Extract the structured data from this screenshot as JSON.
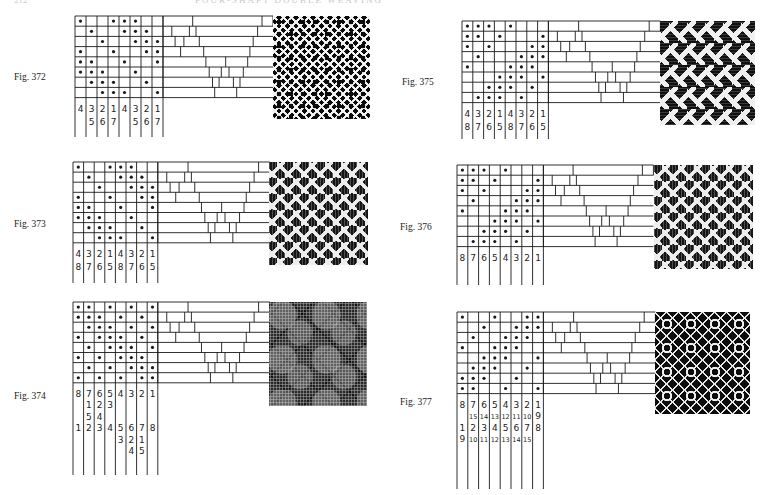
{
  "page": {
    "number": "212",
    "header": "FOUR-SHAFT DOUBLE WEAVING"
  },
  "figures": [
    {
      "id": "fig-372",
      "label": "Fig. 372",
      "label_pos": [
        14,
        72
      ],
      "grid_origin": [
        75,
        16
      ],
      "cell": [
        11,
        10.2
      ],
      "tieup_width": 110,
      "line_extent": 137,
      "swatch": {
        "x": 273,
        "y": 16,
        "w": 97,
        "h": 103,
        "texture": "tex-diamond"
      },
      "dots": [
        [
          1,
          4,
          5,
          6
        ],
        [
          2,
          5,
          6,
          7
        ],
        [
          3,
          6,
          7,
          8
        ],
        [
          1,
          4,
          7,
          8
        ],
        [
          1,
          2,
          5,
          8
        ],
        [
          1,
          2,
          3,
          6
        ],
        [
          2,
          3,
          4,
          7
        ],
        [
          3,
          4,
          5,
          8
        ]
      ],
      "labels": [
        [
          "4",
          "3",
          "2",
          "1",
          "4",
          "3",
          "2",
          "1"
        ],
        [
          "",
          "5",
          "6",
          "7",
          "",
          "5",
          "6",
          "7"
        ]
      ]
    },
    {
      "id": "fig-373",
      "label": "Fig. 373",
      "label_pos": [
        14,
        219
      ],
      "grid_origin": [
        73,
        162
      ],
      "cell": [
        10.6,
        10.1
      ],
      "tieup_width": 112,
      "line_extent": 283,
      "swatch": {
        "x": 269,
        "y": 162,
        "w": 99,
        "h": 103,
        "texture": "tex-zigzag"
      },
      "dots": [
        [
          1,
          4,
          5,
          6
        ],
        [
          2,
          5,
          6,
          7
        ],
        [
          3,
          6,
          7,
          8
        ],
        [
          1,
          4,
          7,
          8
        ],
        [
          1,
          2,
          5,
          8
        ],
        [
          1,
          2,
          3,
          6
        ],
        [
          2,
          3,
          4,
          7
        ],
        [
          3,
          4,
          5,
          8
        ]
      ],
      "labels": [
        [
          "4",
          "3",
          "2",
          "1",
          "4",
          "3",
          "2",
          "1"
        ],
        [
          "8",
          "7",
          "6",
          "5",
          "8",
          "7",
          "6",
          "5"
        ]
      ]
    },
    {
      "id": "fig-374",
      "label": "Fig. 374",
      "label_pos": [
        14,
        391
      ],
      "grid_origin": [
        73,
        302
      ],
      "cell": [
        10.6,
        10.1
      ],
      "tieup_width": 112,
      "line_extent": 475,
      "swatch": {
        "x": 269,
        "y": 302,
        "w": 98,
        "h": 104,
        "texture": "tex-speckle"
      },
      "dots": [
        [
          1,
          2,
          4,
          6,
          8
        ],
        [
          1,
          2,
          3,
          5,
          7
        ],
        [
          2,
          3,
          4,
          6,
          8
        ],
        [
          1,
          3,
          4,
          5,
          7
        ],
        [
          2,
          4,
          5,
          6,
          8
        ],
        [
          1,
          3,
          5,
          6,
          7
        ],
        [
          2,
          4,
          6,
          7,
          8
        ],
        [
          1,
          3,
          5,
          7,
          8
        ]
      ],
      "labels": [
        [
          "8",
          "7",
          "6",
          "5",
          "4",
          "3",
          "2",
          "1"
        ],
        [
          "",
          "1",
          "2",
          "3",
          "",
          "",
          "",
          ""
        ],
        [
          "",
          "5",
          "4",
          "",
          "",
          "",
          "",
          ""
        ],
        [
          "1",
          "2",
          "3",
          "4",
          "5",
          "6",
          "7",
          "8"
        ],
        [
          "",
          "",
          "",
          "",
          "3",
          "2",
          "1",
          ""
        ],
        [
          "",
          "",
          "",
          "",
          "",
          "4",
          "5",
          ""
        ]
      ]
    },
    {
      "id": "fig-375",
      "label": "Fig. 375",
      "label_pos": [
        402,
        77
      ],
      "grid_origin": [
        462,
        21
      ],
      "cell": [
        10.8,
        10.2
      ],
      "tieup_width": 112,
      "line_extent": 139,
      "swatch": {
        "x": 660,
        "y": 21,
        "w": 95,
        "h": 104,
        "texture": "tex-chevron"
      },
      "dots": [
        [
          1,
          2,
          3,
          5
        ],
        [
          1,
          2,
          4,
          8
        ],
        [
          1,
          3,
          7,
          8
        ],
        [
          2,
          6,
          7,
          8
        ],
        [
          1,
          5,
          6,
          7
        ],
        [
          4,
          5,
          6,
          8
        ],
        [
          3,
          4,
          5,
          7
        ],
        [
          2,
          3,
          4,
          6
        ]
      ],
      "labels": [
        [
          "4",
          "3",
          "2",
          "1",
          "4",
          "3",
          "2",
          "1"
        ],
        [
          "8",
          "7",
          "6",
          "5",
          "8",
          "7",
          "6",
          "5"
        ]
      ]
    },
    {
      "id": "fig-376",
      "label": "Fig. 376",
      "label_pos": [
        400,
        222
      ],
      "grid_origin": [
        457,
        165
      ],
      "cell": [
        10.8,
        10.2
      ],
      "tieup_width": 110,
      "line_extent": 285,
      "swatch": {
        "x": 654,
        "y": 165,
        "w": 99,
        "h": 104,
        "texture": "tex-zigzag"
      },
      "dots": [
        [
          1,
          2,
          3,
          5
        ],
        [
          1,
          2,
          4,
          8
        ],
        [
          1,
          3,
          7,
          8
        ],
        [
          2,
          6,
          7,
          8
        ],
        [
          1,
          5,
          6,
          7
        ],
        [
          4,
          5,
          6,
          8
        ],
        [
          3,
          4,
          5,
          7
        ],
        [
          2,
          3,
          4,
          6
        ]
      ],
      "labels": [
        [
          "8",
          "7",
          "6",
          "5",
          "4",
          "3",
          "2",
          "1"
        ]
      ]
    },
    {
      "id": "fig-377",
      "label": "Fig. 377",
      "label_pos": [
        400,
        397
      ],
      "grid_origin": [
        457,
        312
      ],
      "cell": [
        10.8,
        10.2
      ],
      "tieup_width": 112,
      "line_extent": 489,
      "swatch": {
        "x": 655,
        "y": 312,
        "w": 95,
        "h": 102,
        "texture": "tex-diamond2"
      },
      "dots": [
        [
          1,
          4,
          7,
          8
        ],
        [
          3,
          6,
          7,
          8
        ],
        [
          2,
          5,
          6,
          7
        ],
        [
          1,
          4,
          5,
          6
        ],
        [
          3,
          4,
          5,
          8
        ],
        [
          2,
          3,
          4,
          7
        ],
        [
          1,
          2,
          3,
          6
        ],
        [
          1,
          2,
          5,
          8
        ]
      ],
      "labels": [
        [
          "8",
          "7",
          "6",
          "5",
          "4",
          "3",
          "2",
          "1"
        ],
        [
          "",
          "15",
          "14",
          "13",
          "12",
          "11",
          "10",
          "9"
        ],
        [
          "1",
          "2",
          "3",
          "4",
          "5",
          "6",
          "7",
          "8"
        ],
        [
          "9",
          "10",
          "11",
          "12",
          "13",
          "14",
          "15",
          ""
        ]
      ]
    }
  ],
  "tieup_dividers": [
    [
      0.0,
      0.27,
      0.9,
      1.0
    ],
    [
      0.0,
      0.08,
      0.24,
      0.3,
      0.86
    ],
    [
      0.0,
      0.11,
      0.19,
      0.33,
      0.82
    ],
    [
      0.0,
      0.16,
      0.37,
      0.79
    ],
    [
      0.0,
      0.39,
      0.57,
      0.77
    ],
    [
      0.0,
      0.42,
      0.53,
      0.6,
      0.73
    ],
    [
      0.0,
      0.45,
      0.51,
      0.64,
      0.7
    ],
    [
      0.0,
      0.47,
      0.67
    ]
  ],
  "colors": {
    "ink": "#1a1a1a",
    "paper": "#ffffff"
  }
}
